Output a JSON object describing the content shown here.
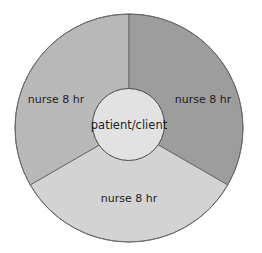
{
  "diagram": {
    "type": "segmented-ring",
    "title": "",
    "center": {
      "label": "patient/client",
      "fill": "#e2e2e2"
    },
    "segments": [
      {
        "label": "nurse 8 hr",
        "position": "upper-left",
        "fill": "#b8b8b8"
      },
      {
        "label": "nurse 8 hr",
        "position": "upper-right",
        "fill": "#9d9d9d"
      },
      {
        "label": "nurse 8 hr",
        "position": "bottom",
        "fill": "#d3d3d3"
      }
    ],
    "stroke_color": "#5a5a5a",
    "background": "#ffffff"
  }
}
